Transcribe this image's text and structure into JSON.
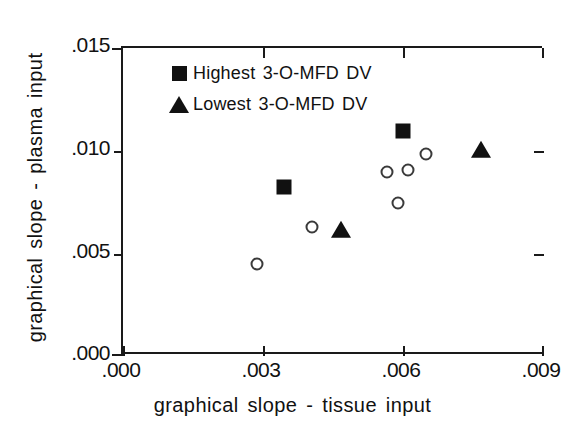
{
  "chart_data": {
    "type": "scatter",
    "title": "",
    "xlabel": "graphical slope - tissue input",
    "ylabel": "graphical slope - plasma input",
    "xlim": [
      0.0,
      0.009
    ],
    "ylim": [
      0.0,
      0.015
    ],
    "xticks": [
      ".000",
      ".003",
      ".006",
      ".009"
    ],
    "xtick_values": [
      0.0,
      0.003,
      0.006,
      0.009
    ],
    "yticks": [
      ".000",
      ".005",
      ".010",
      ".015"
    ],
    "ytick_values": [
      0.0,
      0.005,
      0.01,
      0.015
    ],
    "grid": false,
    "legend_position": "upper-left-inside",
    "series": [
      {
        "name": "Highest 3-O-MFD DV",
        "marker": "filled-square",
        "color": "#111111",
        "points": [
          {
            "x": 0.00346,
            "y": 0.0082
          },
          {
            "x": 0.00601,
            "y": 0.01095
          }
        ]
      },
      {
        "name": "Lowest 3-O-MFD DV",
        "marker": "filled-triangle",
        "color": "#111111",
        "points": [
          {
            "x": 0.00469,
            "y": 0.00608
          },
          {
            "x": 0.00769,
            "y": 0.00998
          }
        ]
      },
      {
        "name": "",
        "marker": "open-circle",
        "color": "#3a3a3a",
        "points": [
          {
            "x": 0.00287,
            "y": 0.0044
          },
          {
            "x": 0.00407,
            "y": 0.00625
          },
          {
            "x": 0.00568,
            "y": 0.0089
          },
          {
            "x": 0.00613,
            "y": 0.009
          },
          {
            "x": 0.00651,
            "y": 0.00978
          },
          {
            "x": 0.00591,
            "y": 0.00742
          }
        ]
      }
    ]
  },
  "legend": {
    "entries": [
      {
        "label": "Highest 3-O-MFD DV",
        "marker": "filled-square"
      },
      {
        "label": "Lowest 3-O-MFD DV",
        "marker": "filled-triangle"
      }
    ]
  },
  "axes": {
    "x_title": "graphical slope - tissue input",
    "y_title": "graphical slope - plasma input",
    "x_tick_labels": [
      ".000",
      ".003",
      ".006",
      ".009"
    ],
    "y_tick_labels": [
      ".000",
      ".005",
      ".010",
      ".015"
    ]
  },
  "caption": {
    "partial_text": ""
  }
}
